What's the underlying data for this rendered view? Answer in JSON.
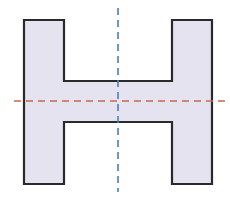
{
  "diagram": {
    "shape": {
      "name": "h-shape",
      "fill": "#e6e3f0",
      "stroke": "#2a2a2a",
      "points": "24,20 64,20 64,81 172,81 172,20 212,20 212,184 172,184 172,122 64,122 64,184 24,184"
    },
    "vertical_axis": {
      "name": "vertical-line-of-symmetry",
      "color": "#4a7fc1",
      "x": 118,
      "y1": 8,
      "y2": 192
    },
    "horizontal_axis": {
      "name": "horizontal-line-of-symmetry",
      "color": "#c8694a",
      "y": 101,
      "x1": 14,
      "x2": 226
    }
  }
}
